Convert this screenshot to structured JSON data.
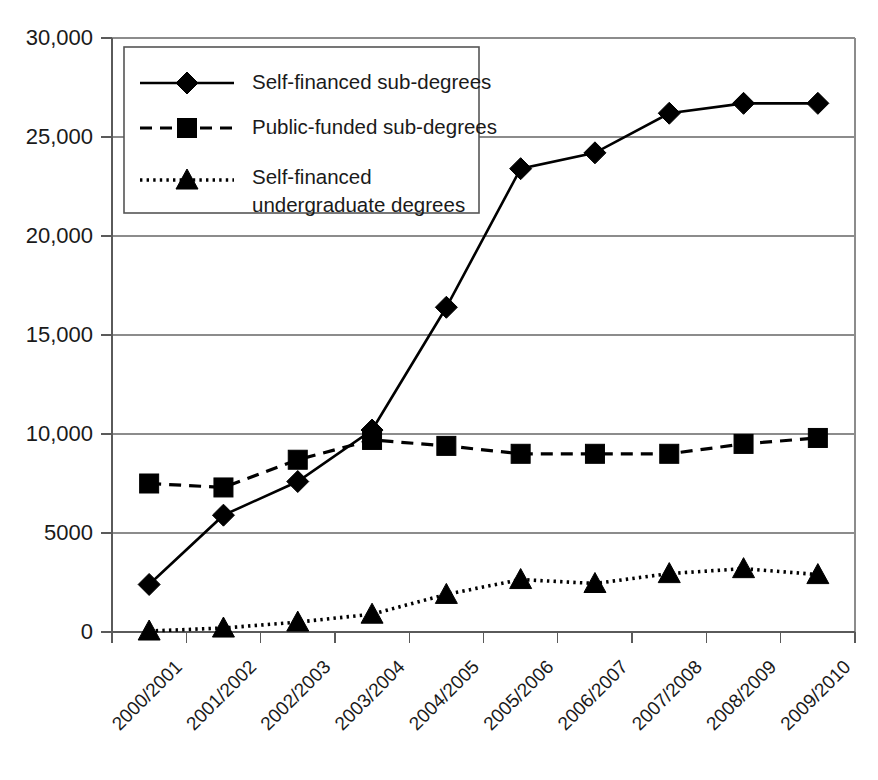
{
  "chart_data": {
    "type": "line",
    "title": "",
    "subtitle": "",
    "xlabel": "",
    "ylabel": "",
    "ylim": [
      0,
      30000
    ],
    "grid": true,
    "legend_position": "top-left",
    "categories": [
      "2000/2001",
      "2001/2002",
      "2002/2003",
      "2003/2004",
      "2004/2005",
      "2005/2006",
      "2006/2007",
      "2007/2008",
      "2008/2009",
      "2009/2010"
    ],
    "y_ticks": [
      {
        "value": 0,
        "label": "0"
      },
      {
        "value": 5000,
        "label": "5000"
      },
      {
        "value": 10000,
        "label": "10,000"
      },
      {
        "value": 15000,
        "label": "15,000"
      },
      {
        "value": 20000,
        "label": "20,000"
      },
      {
        "value": 25000,
        "label": "25,000"
      },
      {
        "value": 30000,
        "label": "30,000"
      }
    ],
    "series": [
      {
        "name": "Self-financed sub-degrees",
        "marker": "diamond",
        "line_style": "solid",
        "values": [
          2400,
          5900,
          7600,
          10200,
          16400,
          23400,
          24200,
          26200,
          26700,
          26700
        ]
      },
      {
        "name": "Public-funded sub-degrees",
        "marker": "square",
        "line_style": "dashed",
        "values": [
          7500,
          7300,
          8700,
          9700,
          9400,
          9000,
          9000,
          9000,
          9500,
          9800
        ]
      },
      {
        "name": "Self-financed undergraduate degrees",
        "marker": "triangle",
        "line_style": "dotted",
        "legend_lines": [
          "Self-financed",
          "undergraduate degrees"
        ],
        "values": [
          50,
          200,
          500,
          900,
          1900,
          2650,
          2450,
          2950,
          3200,
          2900
        ]
      }
    ]
  },
  "legend": {
    "entries": [
      {
        "label": "Self-financed sub-degrees",
        "marker": "diamond",
        "line_style": "solid"
      },
      {
        "label": "Public-funded sub-degrees",
        "marker": "square",
        "line_style": "dashed"
      },
      {
        "label": "Self-financed",
        "label2": "undergraduate degrees",
        "marker": "triangle",
        "line_style": "dotted"
      }
    ]
  },
  "colors": {
    "ink": "#000000",
    "grid": "#8c8c8c",
    "axis": "#5a5a5a",
    "background": "#ffffff"
  }
}
